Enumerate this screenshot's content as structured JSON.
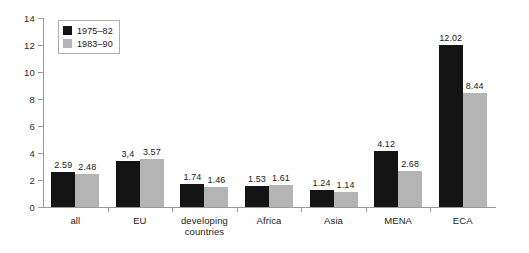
{
  "chart_data": {
    "type": "bar",
    "title": "",
    "subtitle": "",
    "xlabel": "",
    "ylabel": "",
    "ylim": [
      0,
      14
    ],
    "yticks": [
      0,
      2,
      4,
      6,
      8,
      10,
      12,
      14
    ],
    "ytick_labels": [
      "0",
      "2",
      "4",
      "6",
      "8",
      "10",
      "12",
      "14"
    ],
    "grid": false,
    "legend_position": "upper-left-inside",
    "categories": [
      "all",
      "EU",
      "developing\ncountries",
      "Africa",
      "Asia",
      "MENA",
      "ECA"
    ],
    "series": [
      {
        "name": "1975–82",
        "color": "#141414",
        "values": [
          2.59,
          3.4,
          1.74,
          1.53,
          1.24,
          4.12,
          12.02
        ],
        "labels": [
          "2.59",
          "3,4",
          "1.74",
          "1.53",
          "1.24",
          "4.12",
          "12.02"
        ]
      },
      {
        "name": "1983–90",
        "color": "#b4b4b4",
        "values": [
          2.48,
          3.57,
          1.46,
          1.61,
          1.14,
          2.68,
          8.44
        ],
        "labels": [
          "2.48",
          "3.57",
          "1.46",
          "1.61",
          "1.14",
          "2.68",
          "8.44"
        ]
      }
    ]
  },
  "axis": {
    "line_color": "#9a9a9a"
  }
}
